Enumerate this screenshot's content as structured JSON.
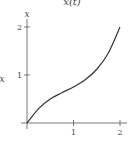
{
  "chart_data": {
    "type": "line",
    "title": "x(t)",
    "xlabel": "",
    "ylabel": "x",
    "y_axis_top_label": "x",
    "xlim": [
      0,
      2.1
    ],
    "ylim": [
      0,
      2.1
    ],
    "x_ticks": [
      1,
      2
    ],
    "x_tick_labels": [
      "1",
      "2"
    ],
    "y_ticks": [
      1,
      2
    ],
    "y_tick_labels": [
      "1",
      "2"
    ],
    "grid": false,
    "legend": null,
    "series": [
      {
        "name": "x(t)",
        "color": "#333333",
        "x": [
          0,
          0.25,
          0.5,
          0.75,
          1.0,
          1.25,
          1.5,
          1.75,
          2.0
        ],
        "y": [
          0,
          0.3,
          0.5,
          0.63,
          0.75,
          0.9,
          1.12,
          1.46,
          2.0
        ]
      }
    ]
  },
  "colors": {
    "background": "#ffffff",
    "axis": "#555555",
    "curve": "#333333",
    "text": "#444444"
  }
}
